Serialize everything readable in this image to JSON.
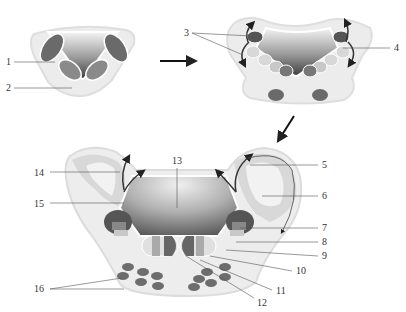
{
  "diagram": {
    "stages": [
      "stage-1-early",
      "stage-2-intermediate",
      "stage-3-late"
    ],
    "labels": {
      "1": "1",
      "2": "2",
      "3": "3",
      "4": "4",
      "5": "5",
      "6": "6",
      "7": "7",
      "8": "8",
      "9": "9",
      "10": "10",
      "11": "11",
      "12": "12",
      "13": "13",
      "14": "14",
      "15": "15",
      "16": "16"
    },
    "colors": {
      "outer_tissue": "#ececec",
      "outer_border": "#dcdcdc",
      "lumen_dark": "#5a5a5a",
      "lumen_light": "#f2f2f2",
      "cell_dark": "#6d6d6d",
      "cell_mid": "#9a9a9a",
      "cell_light": "#d4d4d4",
      "arrow": "#222222",
      "leader": "#555555"
    }
  }
}
